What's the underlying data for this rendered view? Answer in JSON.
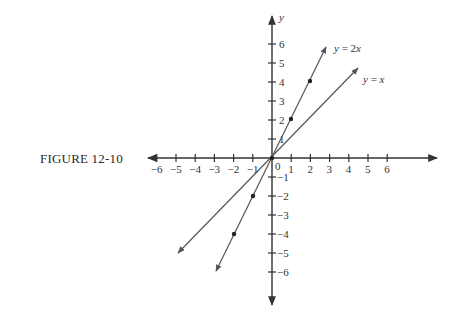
{
  "caption": "FIGURE 12-10",
  "axes": {
    "x_label": "",
    "y_label": "y",
    "x_ticks": [
      "6",
      "5",
      "4",
      "3",
      "2",
      "1",
      "1",
      "2",
      "3",
      "4",
      "5",
      "6"
    ],
    "x_tick_values": [
      -6,
      -5,
      -4,
      -3,
      -2,
      -1,
      1,
      2,
      3,
      4,
      5,
      6
    ],
    "y_ticks_pos": [
      "1",
      "2",
      "3",
      "4",
      "5",
      "6"
    ],
    "y_ticks_neg": [
      "1",
      "2",
      "3",
      "4",
      "5",
      "6"
    ],
    "origin_label": "0",
    "neg_sign": "−"
  },
  "lines": [
    {
      "name": "y = x",
      "label_parts": [
        "y",
        " = ",
        "x"
      ],
      "slope": 1
    },
    {
      "name": "y = 2x",
      "label_parts": [
        "y",
        " = ",
        "2",
        "x"
      ],
      "slope": 2
    }
  ],
  "chart_data": {
    "type": "line",
    "title": "FIGURE 12-10",
    "xlabel": "",
    "ylabel": "y",
    "xlim": [
      -6.5,
      8.8
    ],
    "ylim": [
      -7.8,
      7.4
    ],
    "grid": false,
    "series": [
      {
        "name": "y = x",
        "x": [
          -5,
          4.6
        ],
        "y": [
          -5,
          4.6
        ],
        "marked_points": []
      },
      {
        "name": "y = 2x",
        "x": [
          -3,
          2.9
        ],
        "y": [
          -6,
          5.8
        ],
        "marked_points": [
          [
            -2,
            -4
          ],
          [
            -1,
            -2
          ],
          [
            1,
            2
          ],
          [
            2,
            4
          ]
        ]
      }
    ],
    "annotations": [
      "y = 2x",
      "y = x",
      "0"
    ]
  }
}
